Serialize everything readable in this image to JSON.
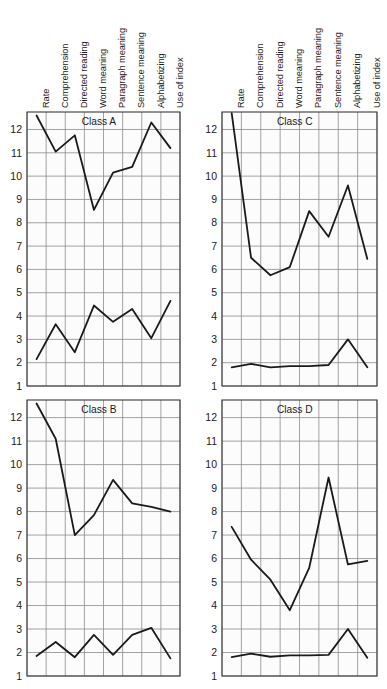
{
  "figure": {
    "background_color": "#ffffff",
    "plot_background_color": "#fcfcfc",
    "grid_color": "#8c8c90",
    "frame_color": "#3a3a3a",
    "series_color": "#1a1a1a"
  },
  "axis": {
    "y_ticks": [
      "12",
      "11",
      "10",
      "9",
      "8",
      "7",
      "6",
      "5",
      "4",
      "3",
      "2",
      "1"
    ],
    "y_min": 1,
    "y_max": 12.75,
    "y_label": "",
    "x_label": ""
  },
  "categories": [
    "Rate",
    "Comprehension",
    "Directed reading",
    "Word meaning",
    "Paragraph meaning",
    "Sentence meaning",
    "Alphabetizing",
    "Use of index"
  ],
  "panels": [
    {
      "id": "class-a",
      "title": "Class A"
    },
    {
      "id": "class-c",
      "title": "Class C"
    },
    {
      "id": "class-b",
      "title": "Class B"
    },
    {
      "id": "class-d",
      "title": "Class D"
    }
  ],
  "chart_data": [
    {
      "type": "line",
      "title": "Class A",
      "xlabel": "",
      "ylabel": "",
      "ylim": [
        1,
        12.75
      ],
      "grid": true,
      "legend": "none",
      "categories": [
        "Rate",
        "Comprehension",
        "Directed reading",
        "Word meaning",
        "Paragraph meaning",
        "Sentence meaning",
        "Alphabetizing",
        "Use of index"
      ],
      "series": [
        {
          "name": "upper",
          "values": [
            12.6,
            11.05,
            11.75,
            8.55,
            10.15,
            10.4,
            12.3,
            11.2
          ]
        },
        {
          "name": "lower",
          "values": [
            2.15,
            3.65,
            2.45,
            4.45,
            3.75,
            4.3,
            3.05,
            4.65
          ]
        }
      ]
    },
    {
      "type": "line",
      "title": "Class C",
      "xlabel": "",
      "ylabel": "",
      "ylim": [
        1,
        12.75
      ],
      "grid": true,
      "legend": "none",
      "categories": [
        "Rate",
        "Comprehension",
        "Directed reading",
        "Word meaning",
        "Paragraph meaning",
        "Sentence meaning",
        "Alphabetizing",
        "Use of index"
      ],
      "series": [
        {
          "name": "upper",
          "values": [
            12.7,
            6.5,
            5.75,
            6.1,
            8.5,
            7.4,
            9.6,
            6.45
          ]
        },
        {
          "name": "lower",
          "values": [
            1.8,
            1.95,
            1.8,
            1.85,
            1.85,
            1.9,
            3.0,
            1.8
          ]
        }
      ]
    },
    {
      "type": "line",
      "title": "Class B",
      "xlabel": "",
      "ylabel": "",
      "ylim": [
        1,
        12.75
      ],
      "grid": true,
      "legend": "none",
      "categories": [
        "Rate",
        "Comprehension",
        "Directed reading",
        "Word meaning",
        "Paragraph meaning",
        "Sentence meaning",
        "Alphabetizing",
        "Use of index"
      ],
      "series": [
        {
          "name": "upper",
          "values": [
            12.6,
            11.1,
            7.0,
            7.85,
            9.35,
            8.35,
            8.2,
            8.0
          ]
        },
        {
          "name": "lower",
          "values": [
            1.85,
            2.45,
            1.8,
            2.75,
            1.9,
            2.75,
            3.05,
            1.75
          ]
        }
      ]
    },
    {
      "type": "line",
      "title": "Class D",
      "xlabel": "",
      "ylabel": "",
      "ylim": [
        1,
        12.75
      ],
      "grid": true,
      "legend": "none",
      "categories": [
        "Rate",
        "Comprehension",
        "Directed reading",
        "Word meaning",
        "Paragraph meaning",
        "Sentence meaning",
        "Alphabetizing",
        "Use of index"
      ],
      "series": [
        {
          "name": "upper",
          "values": [
            7.35,
            5.95,
            5.1,
            3.8,
            5.6,
            9.45,
            5.75,
            5.9
          ]
        },
        {
          "name": "lower",
          "values": [
            1.8,
            1.95,
            1.82,
            1.88,
            1.88,
            1.9,
            3.0,
            1.78
          ]
        }
      ]
    }
  ]
}
